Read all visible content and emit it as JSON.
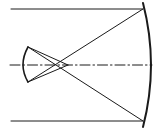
{
  "diagram": {
    "type": "optical-ray-diagram",
    "colors": {
      "stroke": "#1a1a1a",
      "background": "#ffffff"
    },
    "elements": {
      "incoming_ray_top": {
        "x1": 11,
        "y1": 9,
        "x2": 143,
        "y2": 9
      },
      "incoming_ray_bottom": {
        "x1": 11,
        "y1": 121,
        "x2": 143,
        "y2": 121
      },
      "primary_mirror": {
        "top": [
          143,
          3
        ],
        "mid": [
          151,
          65
        ],
        "bottom": [
          143,
          127
        ]
      },
      "optical_axis": {
        "x1": 10,
        "y1": 65,
        "x2": 152,
        "y2": 65,
        "style": "dash-dot"
      },
      "secondary_mirror": {
        "top": [
          28,
          47
        ],
        "mid": [
          23,
          65
        ],
        "bottom": [
          28,
          82
        ]
      },
      "reflected_ray_top": {
        "from": [
          143,
          9
        ],
        "to": [
          28,
          82
        ]
      },
      "reflected_ray_bottom": {
        "from": [
          143,
          121
        ],
        "to": [
          28,
          47
        ]
      },
      "secondary_ray_top": {
        "from": [
          28,
          47
        ],
        "to": [
          68,
          65
        ]
      },
      "secondary_ray_bottom": {
        "from": [
          28,
          82
        ],
        "to": [
          68,
          65
        ]
      }
    }
  }
}
